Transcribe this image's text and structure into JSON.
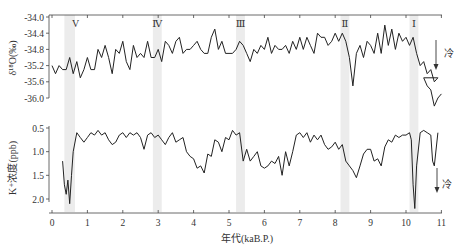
{
  "chart_data": [
    {
      "type": "line",
      "title": "",
      "ylabel": "δ18O(‰)",
      "xlabel": "",
      "ylim": [
        -34.0,
        -36.0
      ],
      "y_ticks": [
        "-34.0",
        "-34.4",
        "-34.8",
        "-35.2",
        "-35.6",
        "-36.0"
      ],
      "y_tick_values": [
        -34.0,
        -34.4,
        -34.8,
        -35.2,
        -35.6,
        -36.0
      ],
      "y_inverted": true,
      "annotation": "冷",
      "annotation_arrow": "down",
      "x": [
        0.0,
        0.1,
        0.2,
        0.3,
        0.4,
        0.5,
        0.6,
        0.7,
        0.8,
        0.9,
        1.0,
        1.1,
        1.2,
        1.3,
        1.4,
        1.5,
        1.6,
        1.7,
        1.8,
        1.9,
        2.0,
        2.1,
        2.2,
        2.3,
        2.4,
        2.5,
        2.6,
        2.7,
        2.8,
        2.9,
        3.0,
        3.1,
        3.2,
        3.3,
        3.4,
        3.5,
        3.6,
        3.7,
        3.8,
        3.9,
        4.0,
        4.1,
        4.2,
        4.3,
        4.4,
        4.5,
        4.6,
        4.7,
        4.8,
        4.9,
        5.0,
        5.1,
        5.2,
        5.3,
        5.4,
        5.5,
        5.6,
        5.7,
        5.8,
        5.9,
        6.0,
        6.1,
        6.2,
        6.3,
        6.4,
        6.5,
        6.6,
        6.7,
        6.8,
        6.9,
        7.0,
        7.1,
        7.2,
        7.3,
        7.4,
        7.5,
        7.6,
        7.7,
        7.8,
        7.9,
        8.0,
        8.1,
        8.2,
        8.3,
        8.4,
        8.5,
        8.6,
        8.7,
        8.8,
        8.9,
        9.0,
        9.1,
        9.2,
        9.3,
        9.4,
        9.5,
        9.6,
        9.7,
        9.8,
        9.9,
        10.0,
        10.1,
        10.2,
        10.3,
        10.4,
        10.5,
        10.6,
        10.7,
        10.8,
        10.9
      ],
      "values": [
        -35.2,
        -35.4,
        -35.2,
        -35.3,
        -35.3,
        -35.0,
        -35.4,
        -35.1,
        -35.5,
        -35.3,
        -35.0,
        -35.3,
        -35.3,
        -34.8,
        -35.0,
        -34.7,
        -35.0,
        -35.4,
        -34.8,
        -34.9,
        -34.6,
        -35.1,
        -35.3,
        -34.7,
        -35.0,
        -34.9,
        -35.0,
        -34.6,
        -35.0,
        -35.0,
        -34.8,
        -35.1,
        -34.6,
        -34.7,
        -34.9,
        -34.6,
        -34.5,
        -34.9,
        -34.8,
        -34.8,
        -34.7,
        -34.6,
        -34.8,
        -34.9,
        -34.9,
        -34.5,
        -34.3,
        -34.8,
        -34.6,
        -34.9,
        -34.9,
        -34.9,
        -34.8,
        -34.6,
        -34.7,
        -34.9,
        -35.1,
        -34.8,
        -34.9,
        -34.7,
        -34.8,
        -34.5,
        -34.9,
        -34.7,
        -34.8,
        -34.8,
        -34.7,
        -34.9,
        -34.6,
        -34.8,
        -34.5,
        -34.8,
        -34.5,
        -34.7,
        -34.9,
        -34.4,
        -34.5,
        -34.5,
        -34.7,
        -34.6,
        -34.4,
        -34.6,
        -34.4,
        -34.6,
        -35.0,
        -35.7,
        -34.9,
        -34.7,
        -35.0,
        -34.6,
        -34.7,
        -34.9,
        -34.4,
        -34.9,
        -34.2,
        -34.7,
        -34.3,
        -34.8,
        -34.4,
        -34.6,
        -34.5,
        -34.7,
        -34.5,
        -34.9,
        -35.2,
        -35.1,
        -35.4,
        -35.3,
        -35.6,
        -35.5
      ],
      "values_tail": {
        "x": [
          10.5,
          10.6,
          10.7,
          10.8,
          10.9,
          11.0
        ],
        "values": [
          -35.5,
          -35.7,
          -35.8,
          -36.2,
          -36.0,
          -35.9
        ]
      }
    },
    {
      "type": "line",
      "title": "",
      "ylabel": "K+浓度(ppb)",
      "xlabel": "年代(kaB.P.)",
      "ylim": [
        0.5,
        2.0
      ],
      "y_ticks": [
        "0.5",
        "1.0",
        "1.5",
        "2.0"
      ],
      "y_tick_values": [
        0.5,
        1.0,
        1.5,
        2.0
      ],
      "y_inverted": true,
      "x_ticks": [
        "0",
        "1",
        "2",
        "3",
        "4",
        "5",
        "6",
        "7",
        "8",
        "9",
        "10",
        "11"
      ],
      "xlim": [
        0,
        11
      ],
      "annotation": "冷",
      "annotation_arrow": "down",
      "x": [
        0.3,
        0.35,
        0.4,
        0.45,
        0.5,
        0.55,
        0.6,
        0.7,
        0.8,
        0.9,
        1.0,
        1.1,
        1.2,
        1.3,
        1.4,
        1.5,
        1.6,
        1.7,
        1.8,
        1.9,
        2.0,
        2.1,
        2.2,
        2.3,
        2.4,
        2.5,
        2.6,
        2.7,
        2.8,
        2.9,
        3.0,
        3.1,
        3.2,
        3.3,
        3.4,
        3.5,
        3.6,
        3.7,
        3.8,
        3.9,
        4.0,
        4.1,
        4.2,
        4.3,
        4.4,
        4.5,
        4.6,
        4.7,
        4.8,
        4.9,
        5.0,
        5.1,
        5.2,
        5.3,
        5.4,
        5.5,
        5.6,
        5.7,
        5.8,
        5.9,
        6.0,
        6.1,
        6.2,
        6.3,
        6.4,
        6.5,
        6.6,
        6.7,
        6.8,
        6.9,
        7.0,
        7.1,
        7.2,
        7.3,
        7.4,
        7.5,
        7.6,
        7.7,
        7.8,
        7.9,
        8.0,
        8.1,
        8.2,
        8.3,
        8.4,
        8.5,
        8.6,
        8.7,
        8.8,
        8.9,
        9.0,
        9.1,
        9.2,
        9.3,
        9.4,
        9.5,
        9.6,
        9.7,
        9.8,
        9.9,
        10.0,
        10.1,
        10.15,
        10.2,
        10.25,
        10.3,
        10.4,
        10.5,
        10.6,
        10.7,
        10.75,
        10.8,
        10.9
      ],
      "values": [
        1.2,
        1.7,
        1.9,
        1.6,
        2.1,
        1.5,
        1.0,
        0.6,
        0.7,
        0.8,
        0.7,
        0.6,
        0.65,
        0.55,
        0.65,
        0.6,
        0.75,
        0.85,
        0.8,
        0.65,
        0.6,
        0.7,
        0.6,
        0.65,
        0.6,
        0.7,
        0.95,
        0.65,
        0.6,
        0.7,
        0.65,
        0.75,
        0.85,
        0.7,
        0.6,
        0.8,
        0.75,
        0.7,
        1.0,
        1.1,
        1.15,
        1.35,
        1.3,
        1.45,
        1.05,
        1.1,
        0.75,
        0.8,
        1.0,
        0.7,
        0.75,
        0.55,
        0.65,
        0.6,
        1.2,
        0.95,
        1.2,
        1.1,
        1.0,
        1.3,
        1.35,
        1.3,
        1.2,
        1.25,
        1.1,
        1.5,
        1.0,
        1.3,
        1.0,
        0.65,
        0.6,
        0.7,
        0.6,
        0.8,
        0.65,
        0.75,
        0.65,
        0.85,
        0.95,
        0.9,
        0.8,
        0.95,
        0.85,
        1.2,
        1.3,
        1.4,
        1.55,
        1.3,
        1.05,
        0.95,
        0.95,
        1.2,
        1.15,
        1.3,
        0.9,
        0.75,
        0.8,
        0.65,
        0.7,
        0.65,
        0.65,
        0.6,
        0.75,
        1.7,
        2.2,
        1.3,
        0.6,
        0.55,
        0.6,
        0.65,
        1.2,
        1.3,
        0.6
      ]
    }
  ],
  "bands": [
    {
      "label": "V",
      "x": 0.35,
      "width": 0.3
    },
    {
      "label": "Ⅳ",
      "x": 2.85,
      "width": 0.25
    },
    {
      "label": "Ⅲ",
      "x": 5.2,
      "width": 0.25
    },
    {
      "label": "Ⅱ",
      "x": 8.15,
      "width": 0.25
    },
    {
      "label": "Ⅰ",
      "x": 10.1,
      "width": 0.25
    }
  ],
  "labels": {
    "top_ylabel": "δ¹⁸O(‰)",
    "bottom_ylabel": "K⁺浓度(ppb)",
    "xlabel": "年代(kaB.P.)",
    "cold_top": "冷",
    "cold_bottom": "冷"
  }
}
